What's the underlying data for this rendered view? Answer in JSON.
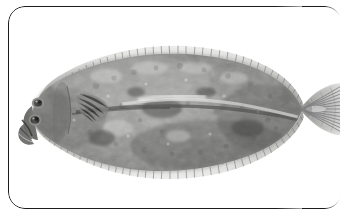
{
  "figure": {
    "common_name": "Flounder",
    "view": "left lateral, eyed side",
    "medium": "black and white photograph",
    "caption": "",
    "background_color": "#ffffff"
  },
  "frame": {
    "style": "rounded-rectangle",
    "border_color": "#1c1c1c",
    "corner_radius_px": 17,
    "right_edge_note": "border fades out / cropped on right side"
  },
  "palette": {
    "background": "#ffffff",
    "body_light": "#c9c9c7",
    "body_mid": "#9a9a97",
    "body_dark": "#6e6e6b",
    "body_darkest": "#4a4a48",
    "fin_gray": "#b6b6b4",
    "fin_ray": "#77777a",
    "eye_dark": "#2e2e2e",
    "highlight": "#efefec"
  },
  "anatomy": [
    {
      "id": "head",
      "label": "Head"
    },
    {
      "id": "eye-upper",
      "label": "Upper eye"
    },
    {
      "id": "eye-lower",
      "label": "Lower eye"
    },
    {
      "id": "mouth",
      "label": "Mouth"
    },
    {
      "id": "operculum",
      "label": "Gill cover"
    },
    {
      "id": "pectoral-fin",
      "label": "Pectoral fin"
    },
    {
      "id": "dorsal-fin",
      "label": "Dorsal fin"
    },
    {
      "id": "anal-fin",
      "label": "Anal fin"
    },
    {
      "id": "caudal-fin",
      "label": "Caudal fin"
    },
    {
      "id": "lateral-line",
      "label": "Lateral line"
    },
    {
      "id": "body",
      "label": "Body"
    }
  ]
}
